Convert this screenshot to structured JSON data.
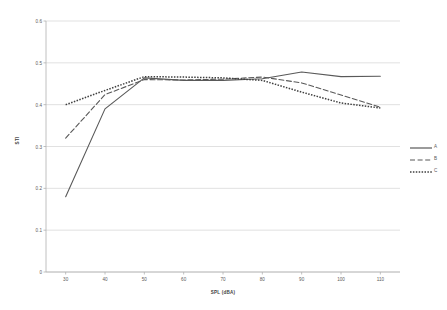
{
  "chart_data": {
    "type": "line",
    "title": "",
    "xlabel": "SPL (dBA)",
    "ylabel": "STI",
    "xlim": [
      25,
      115
    ],
    "ylim": [
      0,
      0.6
    ],
    "xticks": [
      "30",
      "40",
      "50",
      "60",
      "70",
      "80",
      "90",
      "100",
      "110"
    ],
    "yticks": [
      "0",
      "0.1",
      "0.2",
      "0.3",
      "0.4",
      "0.5",
      "0.6"
    ],
    "grid": "horizontal",
    "legend_position": "right",
    "x": [
      30,
      40,
      50,
      60,
      70,
      80,
      90,
      100,
      110
    ],
    "series": [
      {
        "name": "A",
        "style": "solid",
        "color": "#595959",
        "values": [
          0.18,
          0.39,
          0.464,
          0.458,
          0.458,
          0.462,
          0.478,
          0.467,
          0.468
        ]
      },
      {
        "name": "B",
        "style": "dashed",
        "color": "#595959",
        "values": [
          0.32,
          0.424,
          0.46,
          0.459,
          0.461,
          0.466,
          0.452,
          0.423,
          0.394
        ]
      },
      {
        "name": "C",
        "style": "dotted",
        "color": "#3f3f3f",
        "values": [
          0.4,
          0.434,
          0.467,
          0.466,
          0.464,
          0.458,
          0.43,
          0.404,
          0.392
        ]
      }
    ]
  },
  "legend": {
    "items": [
      {
        "label": "A"
      },
      {
        "label": "B"
      },
      {
        "label": "C"
      }
    ]
  },
  "colors": {
    "grid": "#d4d4d4",
    "axis": "#b0b0b0",
    "text": "#5a5a5a",
    "background": "#ffffff"
  }
}
